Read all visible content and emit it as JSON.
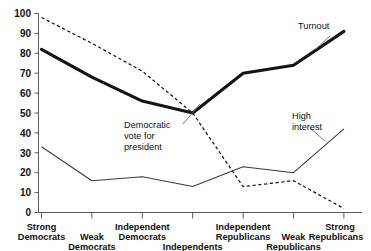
{
  "chart_data": {
    "type": "line",
    "title": "",
    "xlabel": "",
    "ylabel": "",
    "ylim": [
      0,
      100
    ],
    "ytick_step": 10,
    "grid": false,
    "legend": "inline-annotations",
    "categories": [
      "Strong Democrats",
      "Weak Democrats",
      "Independent Democrats",
      "Independents",
      "Independent Republicans",
      "Weak Republicans",
      "Strong Republicans"
    ],
    "yticks": [
      "0",
      "10",
      "20",
      "30",
      "40",
      "50",
      "60",
      "70",
      "80",
      "90",
      "100"
    ],
    "series": [
      {
        "name": "Turnout",
        "style": "thick-solid",
        "values": [
          82,
          68,
          56,
          50,
          70,
          74,
          91
        ]
      },
      {
        "name": "Democratic vote for president",
        "style": "dashed",
        "values": [
          98,
          85,
          71,
          50,
          13,
          16,
          2
        ]
      },
      {
        "name": "High interest",
        "style": "thin-solid",
        "values": [
          33,
          16,
          18,
          13,
          23,
          20,
          42
        ]
      }
    ],
    "annotations": [
      {
        "key": "turnout",
        "text": "Turnout"
      },
      {
        "key": "demvote_line1",
        "text": "Democratic"
      },
      {
        "key": "demvote_line2",
        "text": "vote for"
      },
      {
        "key": "demvote_line3",
        "text": "president"
      },
      {
        "key": "highinterest_line1",
        "text": "High"
      },
      {
        "key": "highinterest_line2",
        "text": "interest"
      }
    ]
  },
  "xlabels": {
    "row_top": [
      {
        "index": 0,
        "line1": "Strong",
        "line2": "Democrats"
      },
      {
        "index": 2,
        "line1": "Independent",
        "line2": "Democrats"
      },
      {
        "index": 4,
        "line1": "Independent",
        "line2": "Republicans"
      },
      {
        "index": 6,
        "line1": "Strong",
        "line2": "Republicans"
      }
    ],
    "row_bottom": [
      {
        "index": 1,
        "line1": "Weak",
        "line2": "Democrats"
      },
      {
        "index": 3,
        "line1": "Independents",
        "line2": ""
      },
      {
        "index": 5,
        "line1": "Weak",
        "line2": "Republicans"
      }
    ]
  },
  "colors": {
    "axis": "#5a5a5a",
    "turnout": "#141414",
    "demvote": "#141414",
    "highinterest": "#3a3a3a",
    "background": "#ffffff"
  }
}
